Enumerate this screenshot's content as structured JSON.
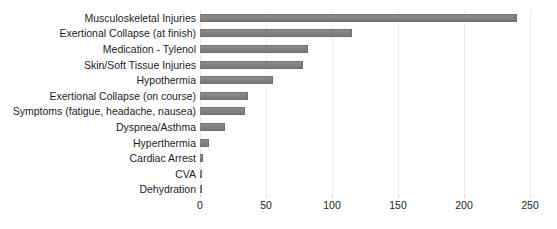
{
  "chart_data": {
    "type": "bar",
    "orientation": "horizontal",
    "title": "",
    "xlabel": "",
    "ylabel": "",
    "xlim": [
      0,
      250
    ],
    "xticks": [
      0,
      50,
      100,
      150,
      200,
      250
    ],
    "xtick_labels": [
      "0",
      "50",
      "100",
      "150",
      "200",
      "250"
    ],
    "grid": true,
    "grid_axis": "x",
    "legend": false,
    "bar_color": "#848484",
    "background_color": "#ffffff",
    "text_color": "#1c1c1c",
    "categories": [
      "Musculoskeletal Injuries",
      "Exertional Collapse (at finish)",
      "Medication - Tylenol",
      "Skin/Soft Tissue Injuries",
      "Hypothermia",
      "Exertional Collapse (on course)",
      "Symptoms (fatigue, headache, nausea)",
      "Dyspnea/Asthma",
      "Hyperthermia",
      "Cardiac Arrest",
      "CVA",
      "Dehydration"
    ],
    "values": [
      240,
      115,
      82,
      78,
      55,
      36,
      34,
      19,
      7,
      2,
      1,
      1
    ]
  }
}
